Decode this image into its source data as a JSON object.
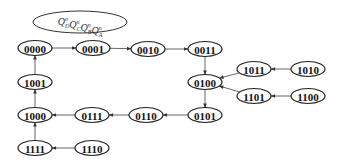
{
  "diagram": {
    "title": {
      "prefix": "Q",
      "parts": [
        {
          "sup": "n",
          "sub": "D"
        },
        {
          "sup": "n",
          "sub": "C"
        },
        {
          "sup": "n",
          "sub": "B"
        },
        {
          "sup": "n",
          "sub": "A"
        }
      ],
      "label": "QnD QnC QnB QnA"
    },
    "nodes": [
      {
        "id": "0000",
        "x": 35,
        "y": 48
      },
      {
        "id": "0001",
        "x": 93,
        "y": 48
      },
      {
        "id": "0010",
        "x": 148,
        "y": 49
      },
      {
        "id": "0011",
        "x": 205,
        "y": 49
      },
      {
        "id": "0100",
        "x": 205,
        "y": 82
      },
      {
        "id": "1011",
        "x": 254,
        "y": 69
      },
      {
        "id": "1010",
        "x": 308,
        "y": 69
      },
      {
        "id": "1101",
        "x": 254,
        "y": 96
      },
      {
        "id": "1100",
        "x": 308,
        "y": 96
      },
      {
        "id": "0101",
        "x": 205,
        "y": 115
      },
      {
        "id": "0110",
        "x": 146,
        "y": 115
      },
      {
        "id": "0111",
        "x": 92,
        "y": 115
      },
      {
        "id": "1000",
        "x": 35,
        "y": 115
      },
      {
        "id": "1001",
        "x": 35,
        "y": 82
      },
      {
        "id": "1111",
        "x": 35,
        "y": 148
      },
      {
        "id": "1110",
        "x": 92,
        "y": 148
      }
    ],
    "edges": [
      [
        "0000",
        "0001"
      ],
      [
        "0001",
        "0010"
      ],
      [
        "0010",
        "0011"
      ],
      [
        "0011",
        "0100"
      ],
      [
        "0100",
        "0101"
      ],
      [
        "0101",
        "0110"
      ],
      [
        "0110",
        "0111"
      ],
      [
        "0111",
        "1000"
      ],
      [
        "1000",
        "1001"
      ],
      [
        "1001",
        "0000"
      ],
      [
        "1010",
        "1011"
      ],
      [
        "1011",
        "0100"
      ],
      [
        "1100",
        "1101"
      ],
      [
        "1101",
        "0100"
      ],
      [
        "1110",
        "1111"
      ],
      [
        "1111",
        "1000"
      ]
    ]
  }
}
